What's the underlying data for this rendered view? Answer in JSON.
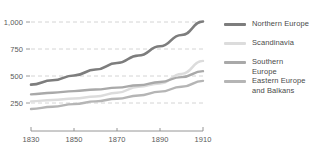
{
  "chart_data": {
    "type": "line",
    "title": "",
    "subtitle": "",
    "xlabel": "",
    "ylabel": "",
    "xlim": [
      1830,
      1910
    ],
    "ylim": [
      150,
      1050
    ],
    "grid": true,
    "legend_position": "right",
    "x_ticks": [
      "1830",
      "1850",
      "1870",
      "1890",
      "1910"
    ],
    "x_tick_values": [
      1830,
      1850,
      1870,
      1890,
      1910
    ],
    "y_ticks": [
      "250",
      "500",
      "750",
      "1,000"
    ],
    "y_tick_values": [
      250,
      500,
      750,
      1000
    ],
    "x": [
      1830,
      1840,
      1850,
      1860,
      1870,
      1880,
      1890,
      1900,
      1910
    ],
    "series": [
      {
        "name": "Northern Europe",
        "color": "#7d7d7d",
        "values": [
          420,
          460,
          505,
          560,
          620,
          690,
          775,
          880,
          1005
        ]
      },
      {
        "name": "Scandinavia",
        "color": "#dcdcdc",
        "values": [
          265,
          278,
          292,
          310,
          345,
          400,
          430,
          520,
          640
        ]
      },
      {
        "name": "Southern Europe",
        "color": "#a9a9a9",
        "values": [
          330,
          345,
          360,
          375,
          392,
          415,
          445,
          490,
          545
        ]
      },
      {
        "name": "Eastern Europe and Balkans",
        "color": "#b5b5b5",
        "values": [
          195,
          215,
          240,
          265,
          290,
          320,
          355,
          400,
          455
        ]
      }
    ]
  },
  "legend": {
    "entries": [
      {
        "label": "Northern Europe",
        "color": "#7d7d7d"
      },
      {
        "label": "Scandinavia",
        "color": "#dcdcdc"
      },
      {
        "label": "Southern Europe",
        "color": "#a9a9a9"
      },
      {
        "label": "Eastern Europe\nand Balkans",
        "color": "#b5b5b5"
      }
    ]
  }
}
